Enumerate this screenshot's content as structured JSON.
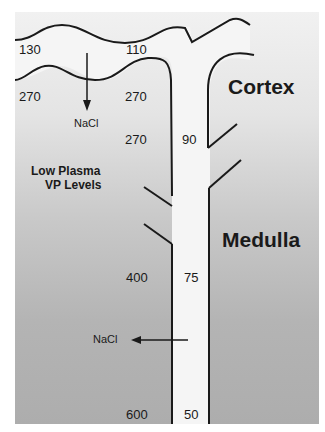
{
  "regions": {
    "cortex": "Cortex",
    "medulla": "Medulla"
  },
  "condition": {
    "line1": "Low Plasma",
    "line2": "VP Levels"
  },
  "values": {
    "top_left": "130",
    "top_mid": "110",
    "cortex_left": "270",
    "cortex_mid": "270",
    "cortex_lower_left": "270",
    "duct_cortex": "90",
    "medulla_interstitium": "400",
    "duct_medulla": "75",
    "papilla_interstitium": "600",
    "duct_papilla": "50"
  },
  "arrows": {
    "cortex_nacl": "NaCl",
    "medulla_nacl": "NaCl"
  },
  "colors": {
    "line": "#1a1a1a",
    "duct_fill": "#f4f4f4"
  }
}
